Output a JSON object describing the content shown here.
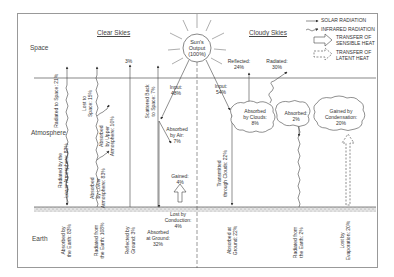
{
  "headers": {
    "clear": "Clear Skies",
    "cloudy": "Cloudy Skies"
  },
  "zones": {
    "space": "Space",
    "atmosphere": "Atmosphere",
    "earth": "Earth"
  },
  "sun": {
    "line1": "Sun's",
    "line2": "Output",
    "line3": "(100%)"
  },
  "legend": {
    "solar": "SOLAR RADIATION",
    "infrared": "INFRARED RADIATION",
    "sensible1": "TRANSFER OF",
    "sensible2": "SENSIBLE HEAT",
    "latent1": "TRANSFER OF",
    "latent2": "LATENT HEAT"
  },
  "clear": {
    "radiated_space": "Radiated to Space: 21%",
    "lost_space_1": "Lost to",
    "lost_space_2": "Space: 15%",
    "absorbed_upper_1": "Absorbed",
    "absorbed_upper_2": "by Upper",
    "absorbed_upper_3": "Atmosphere: 10%",
    "three_pct": "3%",
    "scattered_1": "Scattered Back",
    "scattered_2": "to Space: 7%",
    "input_1": "Input:",
    "input_2": "48%",
    "absorbed_air_1": "Absorbed",
    "absorbed_air_2": "by Air:",
    "absorbed_air_3": "7%",
    "radiated_lower_1": "Radiated by the",
    "radiated_lower_2": "Lower Atmosphere: 83%",
    "absorbed_lower_1": "Absorbed",
    "absorbed_lower_2": "by Lower",
    "absorbed_lower_3": "Atmosphere: 83%",
    "gained_1": "Gained:",
    "gained_2": "4%",
    "lost_conduction_1": "Lost by",
    "lost_conduction_2": "Conduction:",
    "lost_conduction_3": "4%",
    "absorbed_earth_1": "Absorbed by",
    "absorbed_earth_2": "the Earth: 83%",
    "radiated_earth_1": "Radiated from",
    "radiated_earth_2": "the Earth: 108%",
    "reflected_ground_1": "Reflected by",
    "reflected_ground_2": "Ground: 3%",
    "absorbed_ground_1": "Absorbed",
    "absorbed_ground_2": "at Ground:",
    "absorbed_ground_3": "32%"
  },
  "cloudy": {
    "reflected_1": "Reflected:",
    "reflected_2": "24%",
    "radiated_1": "Radiated:",
    "radiated_2": "30%",
    "input_1": "Input:",
    "input_2": "54%",
    "absorbed_clouds_1": "Absorbed",
    "absorbed_clouds_2": "by Clouds:",
    "absorbed_clouds_3": "8%",
    "absorbed_1": "Absorbed:",
    "absorbed_2": "2%",
    "gained_cond_1": "Gained by",
    "gained_cond_2": "Condensation:",
    "gained_cond_3": "20%",
    "transmitted_1": "Transmitted",
    "transmitted_2": "through Clouds: 22%",
    "absorbed_ground_1": "Absorbed at",
    "absorbed_ground_2": "Ground: 22%",
    "radiated_earth_1": "Radiated from",
    "radiated_earth_2": "the Earth: 2%",
    "lost_evap_1": "Lost by",
    "lost_evap_2": "Evaporation: 20%"
  }
}
